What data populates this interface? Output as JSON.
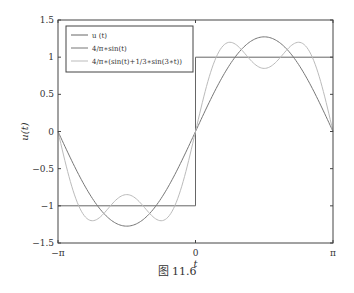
{
  "chart_data": {
    "type": "line",
    "title": "",
    "xlabel": "t",
    "ylabel": "u(t)",
    "xlim": [
      -3.14159,
      3.14159
    ],
    "ylim": [
      -1.5,
      1.5
    ],
    "x_ticks": [
      {
        "value": -3.14159,
        "label": "−π"
      },
      {
        "value": 0,
        "label": "0"
      },
      {
        "value": 3.14159,
        "label": "π"
      }
    ],
    "y_ticks": [
      {
        "value": 1.5,
        "label": "1.5"
      },
      {
        "value": 1,
        "label": "1"
      },
      {
        "value": 0.5,
        "label": "0.5"
      },
      {
        "value": 0,
        "label": "0"
      },
      {
        "value": -0.5,
        "label": "−0.5"
      },
      {
        "value": -1,
        "label": "−1"
      },
      {
        "value": -1.5,
        "label": "−1.5"
      }
    ],
    "grid": false,
    "legend_position": "upper-left",
    "series": [
      {
        "name": "u (t)",
        "color": "#666666",
        "description": "square wave: -1 for t<0, 1 for t>0",
        "x": [
          -3.14159,
          0,
          0,
          3.14159
        ],
        "y": [
          -1,
          -1,
          1,
          1
        ]
      },
      {
        "name": "4/π∗sin(t)",
        "color": "#777777",
        "formula": "4/pi*sin(t)",
        "x": [
          -3.14159,
          -2.356,
          -1.5708,
          -0.785,
          0,
          0.785,
          1.5708,
          2.356,
          3.14159
        ],
        "y": [
          0,
          -0.9,
          -1.273,
          -0.9,
          0,
          0.9,
          1.273,
          0.9,
          0
        ]
      },
      {
        "name": "4/π∗(sin(t)+1/3∗sin(3∗t))",
        "color": "#bbbbbb",
        "formula": "4/pi*(sin(t)+1/3*sin(3*t))",
        "x": [
          -3.14159,
          -2.356,
          -1.9106,
          -1.5708,
          -1.231,
          -0.785,
          0,
          0.785,
          1.231,
          1.5708,
          1.9106,
          2.356,
          3.14159
        ],
        "y": [
          0,
          -1.2,
          -1.2,
          -0.849,
          -1.2,
          -1.2,
          0,
          1.2,
          1.2,
          0.849,
          1.2,
          1.2,
          0
        ]
      }
    ]
  },
  "legend": {
    "items": [
      {
        "label": "u (t)"
      },
      {
        "label": "4/π∗sin(t)"
      },
      {
        "label": "4/π∗(sin(t)+1/3∗sin(3∗t))"
      }
    ]
  },
  "caption": "图 11.6"
}
